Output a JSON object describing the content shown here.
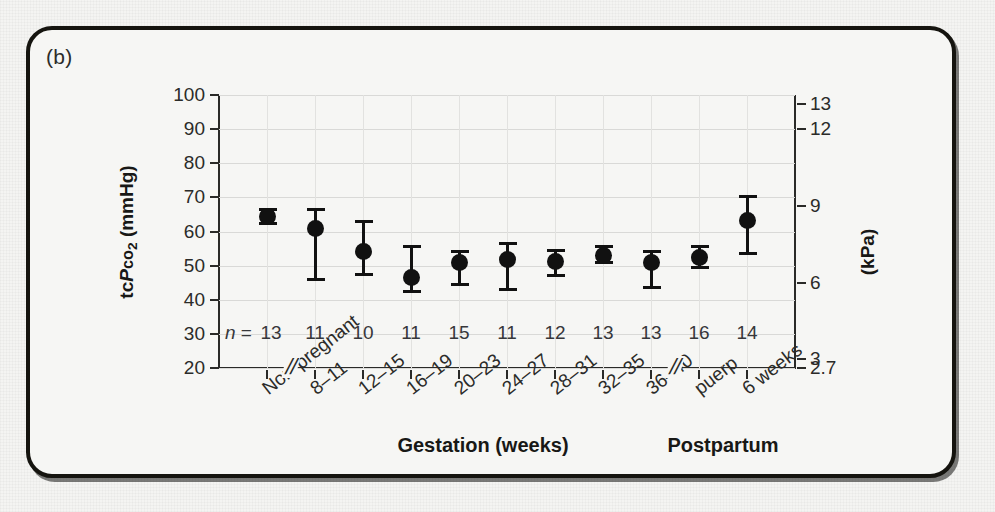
{
  "panel": {
    "tag": "(b)"
  },
  "chart_data": {
    "type": "scatter",
    "title": "",
    "subtitle": "",
    "xlabel": "",
    "ylabel": "tcPco2 (mmHg)",
    "ylabel_secondary": "(kPa)",
    "ylim": [
      20,
      100
    ],
    "ylim_secondary": [
      2.7,
      13
    ],
    "grid": true,
    "legend": false,
    "error_bar_type": "range",
    "categories": [
      "Non-pregnant",
      "8–11",
      "12–15",
      "16–19",
      "20–23",
      "24–27",
      "28–31",
      "32–35",
      "36–40",
      "puerp",
      "6 weeks"
    ],
    "values": [
      64.5,
      61.0,
      54.0,
      46.5,
      50.8,
      51.8,
      51.3,
      53.0,
      50.8,
      52.3,
      63.2
    ],
    "err_low": [
      61.8,
      45.5,
      47.0,
      42.0,
      44.0,
      42.5,
      46.6,
      50.5,
      43.2,
      49.0,
      53.2
    ],
    "err_high": [
      67.0,
      67.0,
      63.5,
      56.0,
      54.6,
      57.0,
      55.0,
      56.0,
      54.5,
      56.0,
      70.8
    ],
    "n_prefix": "n =",
    "n_values": [
      13,
      11,
      10,
      11,
      15,
      11,
      12,
      13,
      13,
      16,
      14
    ],
    "n_row_y_value": 30,
    "yticks": [
      100,
      90,
      80,
      70,
      60,
      50,
      40,
      30,
      20
    ],
    "yticklabels": [
      "100",
      "90",
      "80",
      "70",
      "60",
      "50",
      "40",
      "30",
      "20"
    ],
    "yticks_secondary_mmHg": [
      97.5,
      90,
      67.5,
      45,
      22.5,
      20
    ],
    "yticklabels_secondary": [
      "13",
      "12",
      "9",
      "6",
      "3",
      "2.7"
    ],
    "axis_breaks": [
      "after Non-pregnant",
      "after 36–40"
    ],
    "axis_break_glyph": "//",
    "group_labels": [
      {
        "text": "Gestation (weeks)",
        "spans": "8–11 to 36–40"
      },
      {
        "text": "Postpartum",
        "spans": "puerp to 6 weeks"
      }
    ],
    "marker_color": "#111111",
    "grid_color": "#d9d9d7",
    "axis_color": "#2a2a28"
  }
}
